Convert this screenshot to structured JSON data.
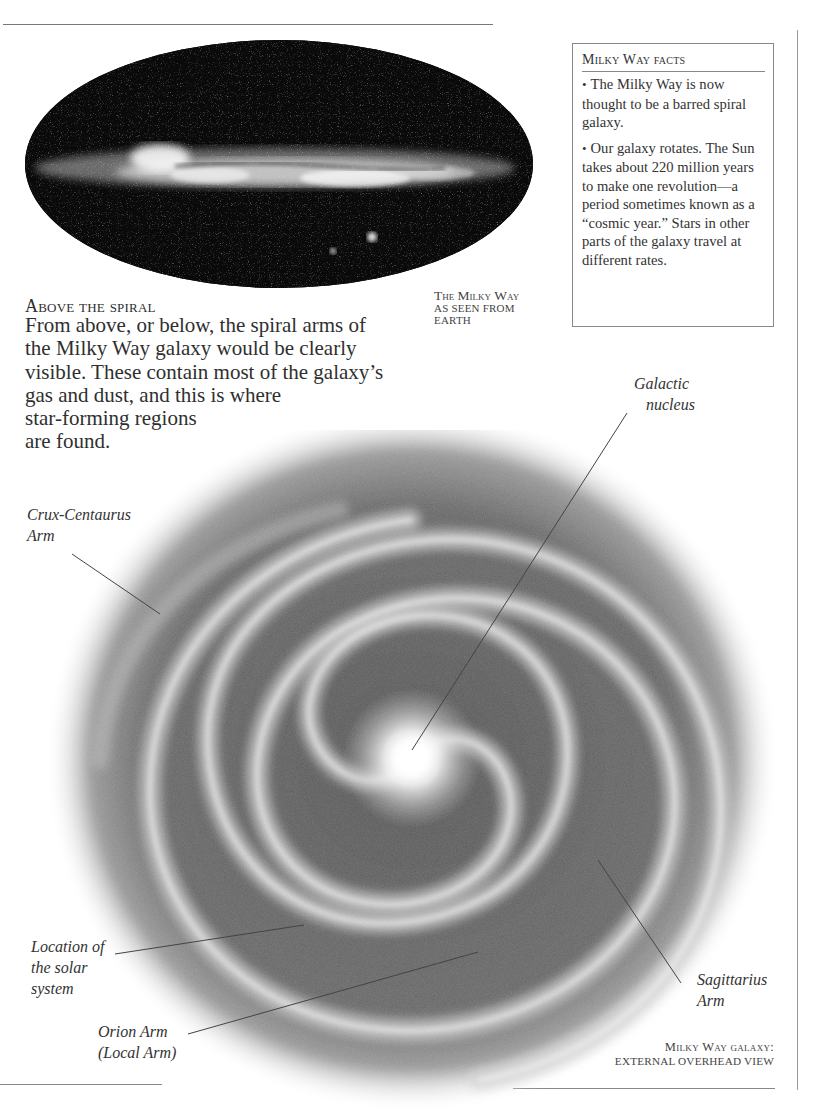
{
  "sky_image": {
    "caption_line1": "The Milky Way",
    "caption_line2": "as seen from",
    "caption_line3": "Earth"
  },
  "facts_box": {
    "title": "Milky Way facts",
    "items": [
      "The Milky Way is now thought to be a barred spiral galaxy.",
      "Our galaxy rotates. The Sun takes about 220 million years to make one revolution—a period sometimes known as a “cosmic year.” Stars in other parts of the galaxy travel at different rates."
    ],
    "bullet": "•"
  },
  "intro": {
    "heading": "Above the spiral",
    "lines": [
      "From above, or below, the spiral arms of",
      "the Milky Way galaxy would be clearly",
      "visible. These contain most of the galaxy’s",
      "gas and dust, and this is where",
      "star-forming regions",
      "are found."
    ]
  },
  "galaxy_labels": {
    "nucleus": [
      "Galactic",
      "nucleus"
    ],
    "crux": [
      "Crux-Centaurus",
      "Arm"
    ],
    "solar": [
      "Location of",
      "the solar",
      "system"
    ],
    "orion": [
      "Orion Arm",
      "(Local Arm)"
    ],
    "sagittarius": [
      "Sagittarius",
      "Arm"
    ]
  },
  "galaxy_caption": {
    "line1": "Milky Way galaxy:",
    "line2": "External overhead view"
  },
  "colors": {
    "rule": "#888888",
    "text": "#2f2f2f",
    "sky": "#0a0a0a"
  }
}
